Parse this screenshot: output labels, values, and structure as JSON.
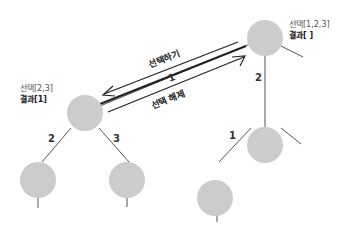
{
  "diagram": {
    "type": "backtracking-permutation-tree",
    "node_color": "#cccccc",
    "edge_color": "#555555",
    "arrow_color": "#222222",
    "root_node": {
      "choices_label": "선택[1,2,3]",
      "result_label": "결과[ ]"
    },
    "left_node": {
      "choices_label": "선택[2,3]",
      "result_label": "결과[1]"
    },
    "edges": {
      "root_to_left": "1",
      "root_to_right": "2",
      "left_to_leftchild": "2",
      "left_to_rightchild": "3",
      "right_to_leftchild": "1"
    },
    "arrows": {
      "forward_label": "선택하기",
      "backward_label": "선택 해제"
    }
  }
}
